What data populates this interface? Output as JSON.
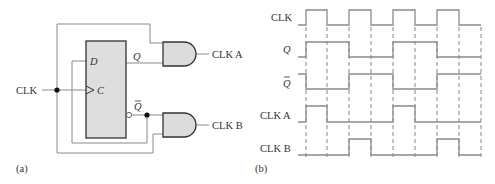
{
  "colors": {
    "wire": "#8a8a8a",
    "outline": "#333333",
    "gate_fill": "#dcdcdc",
    "ff_fill": "#dedede",
    "text": "#333333",
    "dash": "#666666"
  },
  "circuit": {
    "panel_label": "(a)",
    "input_label": "CLK",
    "flipflop": {
      "d_label": "D",
      "c_label": "C",
      "q_label": "Q",
      "qbar_label": "Q"
    },
    "outputs": {
      "a": "CLK A",
      "b": "CLK B"
    }
  },
  "timing": {
    "panel_label": "(b)",
    "signals": [
      {
        "name": "CLK",
        "italic": false,
        "overbar": false
      },
      {
        "name": "Q",
        "italic": true,
        "overbar": false
      },
      {
        "name": "Q",
        "italic": true,
        "overbar": true
      },
      {
        "name": "CLK A",
        "italic": false,
        "overbar": false
      },
      {
        "name": "CLK B",
        "italic": false,
        "overbar": false
      }
    ],
    "edges_x": [
      306,
      327,
      349,
      371,
      393,
      415,
      437,
      459,
      481
    ],
    "waveforms": {
      "CLK": [
        1,
        0,
        1,
        0,
        1,
        0,
        1,
        0
      ],
      "Q": [
        1,
        1,
        0,
        0,
        1,
        1,
        0,
        0
      ],
      "Qbar": [
        0,
        0,
        1,
        1,
        0,
        0,
        1,
        1
      ],
      "CLK_A": [
        1,
        0,
        0,
        0,
        1,
        0,
        0,
        0
      ],
      "CLK_B": [
        0,
        0,
        1,
        0,
        0,
        0,
        1,
        0
      ]
    }
  }
}
